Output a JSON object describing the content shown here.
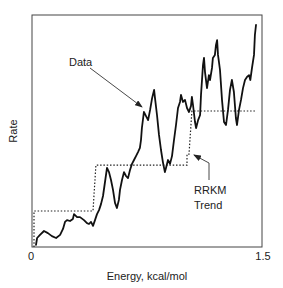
{
  "chart_data": {
    "type": "line",
    "title": "",
    "xlabel": "Energy, kcal/mol",
    "ylabel": "Rate",
    "xlim": [
      0,
      1.5
    ],
    "ylim": [
      0,
      100
    ],
    "x_ticks": [
      {
        "value": 0,
        "label": "0"
      },
      {
        "value": 1.5,
        "label": "1.5"
      }
    ],
    "y_ticks": [],
    "grid": false,
    "legend": null,
    "series": [
      {
        "name": "Data",
        "style": "solid",
        "color": "#111111",
        "points": [
          [
            0.026,
            0.9
          ],
          [
            0.033,
            3.9
          ],
          [
            0.052,
            5.2
          ],
          [
            0.078,
            6.9
          ],
          [
            0.104,
            6.0
          ],
          [
            0.13,
            4.7
          ],
          [
            0.157,
            3.9
          ],
          [
            0.183,
            5.2
          ],
          [
            0.202,
            7.8
          ],
          [
            0.215,
            10.8
          ],
          [
            0.228,
            11.6
          ],
          [
            0.248,
            11.2
          ],
          [
            0.267,
            12.1
          ],
          [
            0.274,
            14.2
          ],
          [
            0.294,
            12.9
          ],
          [
            0.313,
            12.9
          ],
          [
            0.339,
            11.6
          ],
          [
            0.359,
            10.3
          ],
          [
            0.372,
            9.9
          ],
          [
            0.385,
            10.8
          ],
          [
            0.398,
            9.1
          ],
          [
            0.411,
            11.6
          ],
          [
            0.424,
            14.2
          ],
          [
            0.437,
            15.9
          ],
          [
            0.45,
            18.5
          ],
          [
            0.463,
            22.0
          ],
          [
            0.476,
            28.0
          ],
          [
            0.489,
            34.1
          ],
          [
            0.502,
            32.3
          ],
          [
            0.515,
            28.9
          ],
          [
            0.528,
            24.6
          ],
          [
            0.541,
            19.0
          ],
          [
            0.554,
            16.8
          ],
          [
            0.567,
            20.3
          ],
          [
            0.574,
            24.6
          ],
          [
            0.587,
            28.9
          ],
          [
            0.6,
            32.3
          ],
          [
            0.613,
            30.6
          ],
          [
            0.626,
            29.7
          ],
          [
            0.639,
            33.2
          ],
          [
            0.652,
            35.8
          ],
          [
            0.665,
            37.5
          ],
          [
            0.678,
            39.2
          ],
          [
            0.691,
            40.9
          ],
          [
            0.704,
            42.7
          ],
          [
            0.711,
            46.1
          ],
          [
            0.717,
            51.3
          ],
          [
            0.73,
            58.2
          ],
          [
            0.743,
            56.5
          ],
          [
            0.757,
            54.7
          ],
          [
            0.77,
            59.1
          ],
          [
            0.783,
            64.2
          ],
          [
            0.796,
            67.7
          ],
          [
            0.802,
            64.2
          ],
          [
            0.815,
            56.9
          ],
          [
            0.828,
            48.3
          ],
          [
            0.841,
            41.8
          ],
          [
            0.854,
            36.6
          ],
          [
            0.867,
            32.3
          ],
          [
            0.874,
            34.1
          ],
          [
            0.887,
            37.5
          ],
          [
            0.9,
            35.8
          ],
          [
            0.913,
            39.2
          ],
          [
            0.926,
            46.1
          ],
          [
            0.939,
            52.6
          ],
          [
            0.952,
            59.9
          ],
          [
            0.965,
            62.5
          ],
          [
            0.972,
            65.5
          ],
          [
            0.985,
            62.5
          ],
          [
            0.998,
            63.4
          ],
          [
            1.011,
            59.9
          ],
          [
            1.024,
            58.2
          ],
          [
            1.037,
            60.8
          ],
          [
            1.043,
            64.7
          ],
          [
            1.05,
            61.2
          ],
          [
            1.063,
            53.9
          ],
          [
            1.07,
            51.3
          ],
          [
            1.083,
            54.7
          ],
          [
            1.096,
            56.9
          ],
          [
            1.102,
            65.5
          ],
          [
            1.115,
            78.4
          ],
          [
            1.122,
            81.5
          ],
          [
            1.128,
            75.4
          ],
          [
            1.141,
            68.5
          ],
          [
            1.154,
            74.1
          ],
          [
            1.161,
            72.0
          ],
          [
            1.174,
            77.2
          ],
          [
            1.18,
            81.5
          ],
          [
            1.193,
            82.8
          ],
          [
            1.2,
            87.1
          ],
          [
            1.207,
            89.2
          ],
          [
            1.213,
            82.8
          ],
          [
            1.226,
            76.3
          ],
          [
            1.239,
            63.4
          ],
          [
            1.252,
            53.9
          ],
          [
            1.265,
            52.6
          ],
          [
            1.278,
            59.1
          ],
          [
            1.291,
            67.7
          ],
          [
            1.304,
            72.0
          ],
          [
            1.317,
            66.8
          ],
          [
            1.33,
            55.6
          ],
          [
            1.337,
            52.6
          ],
          [
            1.35,
            59.1
          ],
          [
            1.363,
            63.4
          ],
          [
            1.376,
            68.5
          ],
          [
            1.389,
            72.0
          ],
          [
            1.402,
            73.3
          ],
          [
            1.415,
            74.1
          ],
          [
            1.424,
            72.0
          ],
          [
            1.435,
            77.2
          ],
          [
            1.448,
            82.8
          ],
          [
            1.454,
            91.4
          ],
          [
            1.461,
            95.7
          ]
        ]
      },
      {
        "name": "RRKM Trend",
        "style": "dotted",
        "color": "#111111",
        "points": [
          [
            0.013,
            0
          ],
          [
            0.013,
            15.5
          ],
          [
            0.398,
            15.5
          ],
          [
            0.417,
            35.3
          ],
          [
            1.011,
            35.3
          ],
          [
            1.011,
            40.0
          ],
          [
            1.024,
            40.0
          ],
          [
            1.043,
            58.6
          ],
          [
            1.454,
            58.6
          ]
        ]
      }
    ],
    "annotations": [
      {
        "text": "Data",
        "arrow_to": [
          0.728,
          55.6
        ]
      },
      {
        "text": "RRKM\nTrend",
        "arrow_to": [
          1.05,
          39.7
        ]
      }
    ]
  },
  "labels": {
    "xlabel": "Energy, kcal/mol",
    "ylabel": "Rate",
    "x_tick_min": "0",
    "x_tick_max": "1.5",
    "annotation_data": "Data",
    "annotation_rrkm_line1": "RRKM",
    "annotation_rrkm_line2": "Trend"
  }
}
